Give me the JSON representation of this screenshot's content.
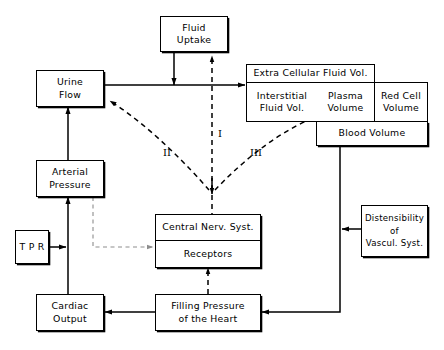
{
  "diagram": {
    "nodes": {
      "fluid_uptake": {
        "lines": [
          "Fluid",
          "Uptake"
        ]
      },
      "urine_flow": {
        "lines": [
          "Urine",
          "Flow"
        ]
      },
      "arterial_pressure": {
        "lines": [
          "Arterial",
          "Pressure"
        ]
      },
      "tpr": {
        "lines": [
          "T P R"
        ]
      },
      "cardiac_output": {
        "lines": [
          "Cardiac",
          "Output"
        ]
      },
      "filling_pressure": {
        "lines": [
          "Filling Pressure",
          "of the Heart"
        ]
      },
      "central_nerv_syst": {
        "lines": [
          "Central Nerv. Syst."
        ]
      },
      "receptors": {
        "lines": [
          "Receptors"
        ]
      },
      "distensibility": {
        "lines": [
          "Distensibility",
          "of",
          "Vascul. Syst."
        ]
      },
      "extra_cellular_fluid_vol": {
        "lines": [
          "Extra Cellular Fluid Vol."
        ]
      },
      "interstitial_fluid_vol": {
        "lines": [
          "Interstitial",
          "Fluid Vol."
        ]
      },
      "plasma_volume": {
        "lines": [
          "Plasma",
          "Volume"
        ]
      },
      "red_cell_volume": {
        "lines": [
          "Red Cell",
          "Volume"
        ]
      },
      "blood_volume": {
        "lines": [
          "Blood Volume"
        ]
      }
    },
    "annotations": {
      "pathway_1": "I",
      "pathway_2": "II",
      "pathway_3": "III"
    },
    "colors": {
      "stroke": "#000000",
      "background": "#ffffff",
      "faint_stroke": "#9a9a9a"
    }
  }
}
